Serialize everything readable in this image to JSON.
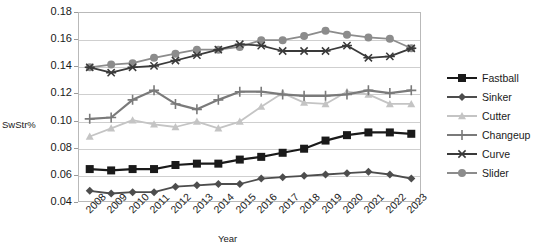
{
  "figure": {
    "clipped_caption": "",
    "y_axis_title": "SwStr%",
    "x_axis_title": "Year"
  },
  "legend": {
    "items": [
      {
        "label": "Fastball",
        "color": "#1a1a1a",
        "marker": "square"
      },
      {
        "label": "Sinker",
        "color": "#4d4d4d",
        "marker": "diamond"
      },
      {
        "label": "Cutter",
        "color": "#c4c4c4",
        "marker": "triangle"
      },
      {
        "label": "Changeup",
        "color": "#7a7a7a",
        "marker": "cross"
      },
      {
        "label": "Curve",
        "color": "#3a3a3a",
        "marker": "star"
      },
      {
        "label": "Slider",
        "color": "#8c8c8c",
        "marker": "circle"
      }
    ]
  },
  "chart_data": {
    "type": "line",
    "title": "",
    "xlabel": "Year",
    "ylabel": "SwStr%",
    "ylim": [
      0.04,
      0.18
    ],
    "yticks": [
      "0.04",
      "0.06",
      "0.08",
      "0.10",
      "0.12",
      "0.14",
      "0.16",
      "0.18"
    ],
    "grid": true,
    "legend_position": "right",
    "categories": [
      "2008",
      "2009",
      "2010",
      "2011",
      "2012",
      "2013",
      "2014",
      "2015",
      "2016",
      "2017",
      "2018",
      "2019",
      "2020",
      "2021",
      "2022",
      "2023"
    ],
    "series": [
      {
        "name": "Fastball",
        "color": "#1a1a1a",
        "marker": "square",
        "values": [
          0.065,
          0.064,
          0.065,
          0.065,
          0.068,
          0.069,
          0.069,
          0.072,
          0.074,
          0.077,
          0.08,
          0.086,
          0.09,
          0.092,
          0.092,
          0.091
        ]
      },
      {
        "name": "Sinker",
        "color": "#4d4d4d",
        "marker": "diamond",
        "values": [
          0.049,
          0.047,
          0.048,
          0.048,
          0.052,
          0.053,
          0.054,
          0.054,
          0.058,
          0.059,
          0.06,
          0.061,
          0.062,
          0.063,
          0.061,
          0.058
        ]
      },
      {
        "name": "Cutter",
        "color": "#c4c4c4",
        "marker": "triangle",
        "values": [
          0.089,
          0.095,
          0.101,
          0.098,
          0.096,
          0.1,
          0.095,
          0.1,
          0.111,
          0.121,
          0.114,
          0.113,
          0.122,
          0.12,
          0.113,
          0.113
        ]
      },
      {
        "name": "Changeup",
        "color": "#7a7a7a",
        "marker": "cross",
        "values": [
          0.102,
          0.103,
          0.116,
          0.123,
          0.113,
          0.109,
          0.116,
          0.122,
          0.122,
          0.12,
          0.119,
          0.119,
          0.12,
          0.123,
          0.121,
          0.123
        ]
      },
      {
        "name": "Curve",
        "color": "#3a3a3a",
        "marker": "star",
        "values": [
          0.14,
          0.136,
          0.14,
          0.141,
          0.145,
          0.149,
          0.153,
          0.157,
          0.156,
          0.152,
          0.152,
          0.152,
          0.156,
          0.147,
          0.148,
          0.154
        ]
      },
      {
        "name": "Slider",
        "color": "#8c8c8c",
        "marker": "circle",
        "values": [
          0.14,
          0.142,
          0.143,
          0.147,
          0.15,
          0.153,
          0.153,
          0.155,
          0.16,
          0.16,
          0.163,
          0.167,
          0.164,
          0.162,
          0.161,
          0.154
        ]
      }
    ]
  }
}
